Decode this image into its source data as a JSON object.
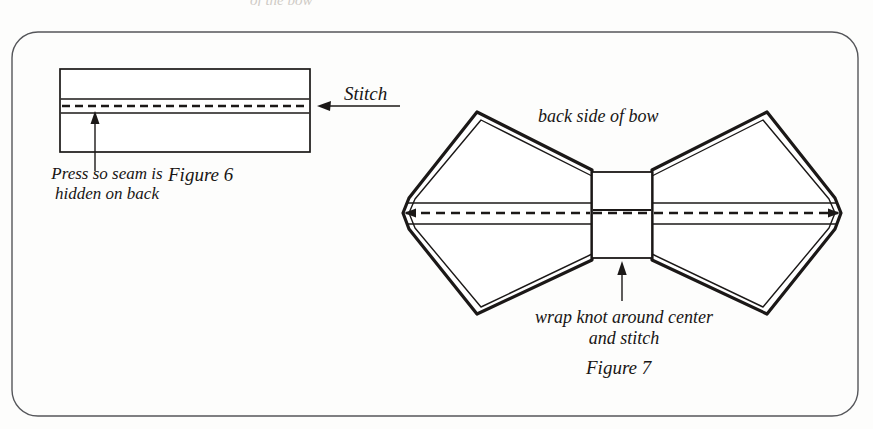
{
  "page": {
    "background_color": "#fdfdfc",
    "ink_color": "#181514",
    "border_color": "#4a4a4a",
    "top_cut_text": "of the bow"
  },
  "figure6": {
    "caption": "Figure 6",
    "stitch_label": "Stitch",
    "press_label": "Press so seam is hidden on back",
    "panel": {
      "x": 60,
      "y": 69,
      "width": 250,
      "height": 83,
      "seam_line_top_y": 99,
      "dashed_stitch_line_y": 106,
      "seam_line_bottom_y": 113
    },
    "stitch_arrow": {
      "from_x": 400,
      "to_x": 318,
      "y": 106,
      "direction": "left"
    },
    "press_arrow": {
      "x": 95,
      "from_y": 171,
      "to_y": 114,
      "direction": "up"
    }
  },
  "figure7": {
    "caption": "Figure 7",
    "title_label": "back side of bow",
    "knot_label": "wrap knot around center and stitch",
    "knot": {
      "x": 592,
      "y": 172,
      "width": 60,
      "height": 86,
      "divider_y": 210
    },
    "bow": {
      "center_y": 213,
      "left_tip_x": 408,
      "right_tip_x": 838,
      "band_top_y": 203,
      "band_bottom_y": 224,
      "dashed_center_line_y": 213
    },
    "knot_arrow": {
      "x": 622,
      "from_y": 301,
      "to_y": 262,
      "direction": "up"
    }
  },
  "icons": {
    "arrow_left": "arrow-left-icon",
    "arrow_up": "arrow-up-icon"
  }
}
